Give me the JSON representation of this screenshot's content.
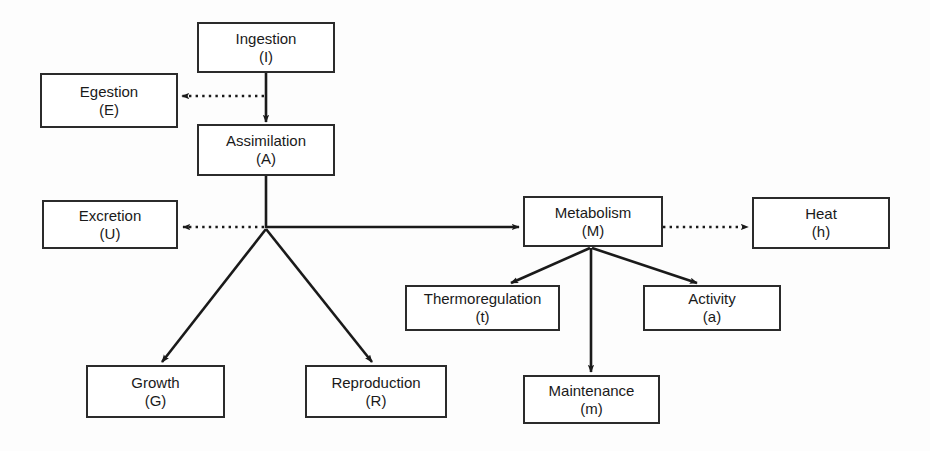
{
  "diagram": {
    "colors": {
      "background": "#fdfdfd",
      "box_fill": "#ffffff",
      "box_stroke": "#2b2b2b",
      "edge_stroke": "#1a1a1a"
    },
    "nodes": [
      {
        "id": "ingestion",
        "title": "Ingestion",
        "symbol": "(I)",
        "x": 197,
        "y": 22,
        "w": 138,
        "h": 51
      },
      {
        "id": "egestion",
        "title": "Egestion",
        "symbol": "(E)",
        "x": 40,
        "y": 73,
        "w": 138,
        "h": 55
      },
      {
        "id": "assimilation",
        "title": "Assimilation",
        "symbol": "(A)",
        "x": 197,
        "y": 124,
        "w": 138,
        "h": 52
      },
      {
        "id": "excretion",
        "title": "Excretion",
        "symbol": "(U)",
        "x": 42,
        "y": 200,
        "w": 136,
        "h": 49
      },
      {
        "id": "metabolism",
        "title": "Metabolism",
        "symbol": "(M)",
        "x": 523,
        "y": 196,
        "w": 140,
        "h": 51
      },
      {
        "id": "heat",
        "title": "Heat",
        "symbol": "(h)",
        "x": 752,
        "y": 197,
        "w": 138,
        "h": 52
      },
      {
        "id": "thermoregulation",
        "title": "Thermoregulation",
        "symbol": "(t)",
        "x": 405,
        "y": 285,
        "w": 155,
        "h": 46
      },
      {
        "id": "activity",
        "title": "Activity",
        "symbol": "(a)",
        "x": 643,
        "y": 285,
        "w": 138,
        "h": 46
      },
      {
        "id": "growth",
        "title": "Growth",
        "symbol": "(G)",
        "x": 86,
        "y": 365,
        "w": 139,
        "h": 53
      },
      {
        "id": "reproduction",
        "title": "Reproduction",
        "symbol": "(R)",
        "x": 305,
        "y": 365,
        "w": 142,
        "h": 53
      },
      {
        "id": "maintenance",
        "title": "Maintenance",
        "symbol": "(m)",
        "x": 523,
        "y": 375,
        "w": 137,
        "h": 49
      }
    ],
    "edges": [
      {
        "id": "ingestion-to-assimilation",
        "from": "ingestion",
        "to": "assimilation",
        "style": "solid",
        "label": ""
      },
      {
        "id": "ingestion-to-egestion",
        "from": "ingestion",
        "to": "egestion",
        "style": "dotted",
        "label": ""
      },
      {
        "id": "assimilation-to-excretion",
        "from": "assimilation",
        "to": "excretion",
        "style": "dotted",
        "label": ""
      },
      {
        "id": "assimilation-to-metabolism",
        "from": "assimilation",
        "to": "metabolism",
        "style": "solid",
        "label": ""
      },
      {
        "id": "assimilation-to-growth",
        "from": "assimilation",
        "to": "growth",
        "style": "solid",
        "label": ""
      },
      {
        "id": "assimilation-to-reproduction",
        "from": "assimilation",
        "to": "reproduction",
        "style": "solid",
        "label": ""
      },
      {
        "id": "metabolism-to-heat",
        "from": "metabolism",
        "to": "heat",
        "style": "dotted",
        "label": ""
      },
      {
        "id": "metabolism-to-thermoregulation",
        "from": "metabolism",
        "to": "thermoregulation",
        "style": "solid",
        "label": ""
      },
      {
        "id": "metabolism-to-maintenance",
        "from": "metabolism",
        "to": "maintenance",
        "style": "solid",
        "label": ""
      },
      {
        "id": "metabolism-to-activity",
        "from": "metabolism",
        "to": "activity",
        "style": "solid",
        "label": ""
      }
    ]
  }
}
